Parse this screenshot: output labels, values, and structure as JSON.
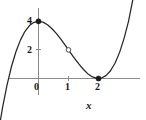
{
  "figure": {
    "background_color": "#ffffff",
    "width": 146,
    "height": 120
  },
  "axes": {
    "x_axis_title": "x",
    "y_axis_title": "",
    "axis_color": "#8c8c8c",
    "curve_color": "#262626",
    "x_ticks": [
      {
        "value": 0,
        "label": "0"
      },
      {
        "value": 1,
        "label": "1"
      },
      {
        "value": 2,
        "label": "2"
      }
    ],
    "y_ticks": [
      {
        "value": 2,
        "label": "2"
      },
      {
        "value": 4,
        "label": "4"
      }
    ]
  },
  "chart_data": {
    "type": "line",
    "title": "",
    "subtitle": "",
    "xlabel": "x",
    "ylabel": "",
    "grid": false,
    "legend": null,
    "function": "y = x^3 - 3x^2 + 4",
    "xlim": [
      -1.35,
      3.2
    ],
    "ylim": [
      -0.55,
      5.6
    ],
    "x": [
      -1.35,
      -1.2,
      -1.05,
      -0.9,
      -0.75,
      -0.6,
      -0.45,
      -0.3,
      -0.15,
      0,
      0.15,
      0.3,
      0.45,
      0.6,
      0.75,
      0.9,
      1.05,
      1.2,
      1.35,
      1.5,
      1.65,
      1.8,
      1.95,
      2.1,
      2.25,
      2.4,
      2.55,
      2.7,
      2.85,
      3,
      3.2
    ],
    "values": [
      -3.93,
      -2.05,
      -0.47,
      0.84,
      1.89,
      2.7,
      3.3,
      3.7,
      3.93,
      4,
      3.94,
      3.76,
      3.48,
      3.14,
      2.73,
      2.3,
      1.85,
      1.41,
      1.0,
      0.63,
      0.32,
      0.11,
      0.01,
      0.03,
      0.2,
      0.54,
      1.07,
      1.81,
      2.79,
      4,
      6.1
    ],
    "markers": [
      {
        "name": "local-maximum",
        "x": 0,
        "y": 4,
        "style": "filled",
        "label": ""
      },
      {
        "name": "inflection-point",
        "x": 1,
        "y": 2,
        "style": "open",
        "label": ""
      },
      {
        "name": "local-minimum",
        "x": 2,
        "y": 0,
        "style": "filled",
        "label": ""
      }
    ]
  }
}
